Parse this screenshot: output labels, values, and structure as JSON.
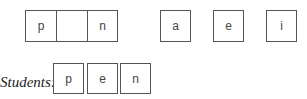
{
  "word_frame": {
    "cells": [
      "p",
      "",
      "n"
    ]
  },
  "vowel_choices": [
    "a",
    "e",
    "i"
  ],
  "students": {
    "label": "Students:",
    "cells": [
      "p",
      "e",
      "n"
    ]
  }
}
